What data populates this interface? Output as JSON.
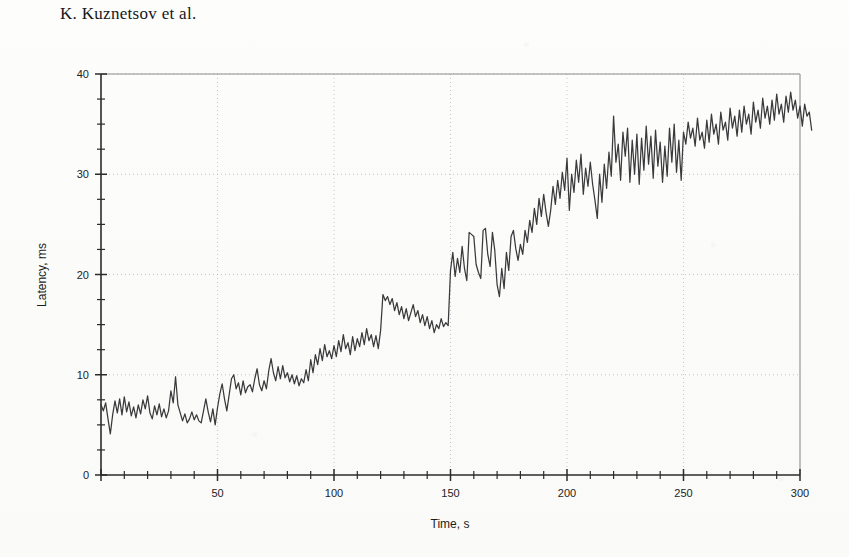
{
  "header": {
    "running_title": "K. Kuznetsov et al."
  },
  "chart_data": {
    "type": "line",
    "title": "",
    "xlabel": "Time, s",
    "ylabel": "Latency, ms",
    "xlim": [
      0,
      300
    ],
    "ylim": [
      0,
      40
    ],
    "xticks": [
      0,
      50,
      100,
      150,
      200,
      250,
      300
    ],
    "xticklabels": [
      "",
      "50",
      "100",
      "150",
      "200",
      "250",
      "300"
    ],
    "yticks": [
      0,
      10,
      20,
      30,
      40
    ],
    "yticklabels": [
      "0",
      "10",
      "20",
      "30",
      "40"
    ],
    "x_minor_step": 10,
    "y_minor_step": 2.5,
    "grid": true,
    "grid_style": "dotted",
    "legend": null,
    "line_color": "#3a3a3c",
    "series": [
      {
        "name": "latency",
        "x_start": 0,
        "x_step": 1,
        "values": [
          7.0,
          6.4,
          7.2,
          5.6,
          4.1,
          6.0,
          7.4,
          6.2,
          7.6,
          6.0,
          7.8,
          6.3,
          7.3,
          5.9,
          6.8,
          5.7,
          7.0,
          6.1,
          7.5,
          6.6,
          7.9,
          6.2,
          5.6,
          6.9,
          6.0,
          7.1,
          5.8,
          6.6,
          5.7,
          6.4,
          8.4,
          7.2,
          9.8,
          7.0,
          6.2,
          5.4,
          6.1,
          5.2,
          5.6,
          6.3,
          5.5,
          6.0,
          5.4,
          5.2,
          6.4,
          7.6,
          6.3,
          5.3,
          6.6,
          5.0,
          6.7,
          8.1,
          9.1,
          7.6,
          6.4,
          8.0,
          9.6,
          10.0,
          8.6,
          9.2,
          8.0,
          9.4,
          8.2,
          8.8,
          9.0,
          8.3,
          9.6,
          10.6,
          9.0,
          8.4,
          9.4,
          8.6,
          10.4,
          11.6,
          10.2,
          9.4,
          10.8,
          9.6,
          10.9,
          9.7,
          10.2,
          9.3,
          10.0,
          9.1,
          9.9,
          8.9,
          9.6,
          9.2,
          10.5,
          9.4,
          11.5,
          10.2,
          12.0,
          11.0,
          12.6,
          11.4,
          13.0,
          11.8,
          12.4,
          11.6,
          12.9,
          11.8,
          13.4,
          12.3,
          14.0,
          12.6,
          13.2,
          12.0,
          13.8,
          12.4,
          13.6,
          12.8,
          14.2,
          13.0,
          14.6,
          13.4,
          14.0,
          12.8,
          13.9,
          12.6,
          14.4,
          18.0,
          17.4,
          17.8,
          17.0,
          17.6,
          16.4,
          17.2,
          16.0,
          16.8,
          15.6,
          16.6,
          15.4,
          16.2,
          17.0,
          15.8,
          16.4,
          15.2,
          16.0,
          14.9,
          15.8,
          14.6,
          15.4,
          14.2,
          15.0,
          14.6,
          15.6,
          14.8,
          15.2,
          14.9,
          20.4,
          22.2,
          19.8,
          21.6,
          20.2,
          22.8,
          20.6,
          19.4,
          24.2,
          24.0,
          23.8,
          21.0,
          20.2,
          19.6,
          24.4,
          24.6,
          22.0,
          20.8,
          24.2,
          22.4,
          19.0,
          17.8,
          20.6,
          18.6,
          22.2,
          20.4,
          23.8,
          24.4,
          22.6,
          21.4,
          23.0,
          22.0,
          24.4,
          23.2,
          25.4,
          24.2,
          26.6,
          25.0,
          27.6,
          25.8,
          28.0,
          26.2,
          24.8,
          26.4,
          28.8,
          27.0,
          29.4,
          27.6,
          30.2,
          28.4,
          31.6,
          26.4,
          30.0,
          28.2,
          31.4,
          29.2,
          32.0,
          28.0,
          30.6,
          28.8,
          31.2,
          29.0,
          27.4,
          25.6,
          30.0,
          27.2,
          31.0,
          28.6,
          32.2,
          29.8,
          35.8,
          31.2,
          33.0,
          29.4,
          34.2,
          31.8,
          34.6,
          29.2,
          33.4,
          30.0,
          34.0,
          29.0,
          33.6,
          30.4,
          34.8,
          31.0,
          33.8,
          29.6,
          34.4,
          30.8,
          33.2,
          29.2,
          32.8,
          29.8,
          34.6,
          31.2,
          35.0,
          30.2,
          33.4,
          29.4,
          34.2,
          33.0,
          35.2,
          33.6,
          34.6,
          32.8,
          35.6,
          33.4,
          34.2,
          32.6,
          35.4,
          33.2,
          36.0,
          34.0,
          35.0,
          33.0,
          36.2,
          34.4,
          35.2,
          33.4,
          36.6,
          34.6,
          35.8,
          33.8,
          36.4,
          34.2,
          36.8,
          35.0,
          36.0,
          34.0,
          37.2,
          35.2,
          36.4,
          34.6,
          37.6,
          35.6,
          36.8,
          35.0,
          37.4,
          35.4,
          38.0,
          36.0,
          37.0,
          35.2,
          37.8,
          36.2,
          38.2,
          36.4,
          37.4,
          35.6,
          36.8,
          34.8,
          37.0,
          35.8,
          36.2,
          34.4
        ]
      }
    ]
  }
}
